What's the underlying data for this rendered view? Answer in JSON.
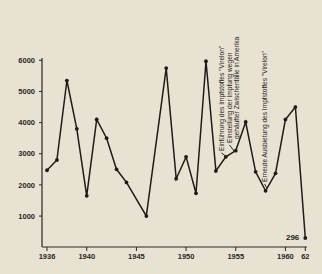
{
  "chart_data": {
    "type": "line",
    "title": "",
    "xlabel": "",
    "ylabel": "",
    "ylim": [
      0,
      6000
    ],
    "grid": false,
    "y_ticks": [
      1000,
      2000,
      3000,
      4000,
      5000,
      6000
    ],
    "y_tick_labels": [
      "1000",
      "2000",
      "3000",
      "4000",
      "5000",
      "6000"
    ],
    "x_ticks": [
      1936,
      1940,
      1945,
      1950,
      1955,
      1960,
      1962
    ],
    "x_tick_labels": [
      "1936",
      "1940",
      "1945",
      "1950",
      "1955",
      "1960",
      "62"
    ],
    "series": [
      {
        "name": "cases",
        "x": [
          1936,
          1937,
          1938,
          1939,
          1940,
          1941,
          1942,
          1943,
          1944,
          1946,
          1948,
          1949,
          1950,
          1951,
          1952,
          1953,
          1954,
          1955,
          1956,
          1957,
          1958,
          1959,
          1960,
          1961,
          1962
        ],
        "values": [
          2470,
          2800,
          5350,
          3800,
          1650,
          4100,
          3500,
          2500,
          2080,
          1000,
          5750,
          2200,
          2900,
          1730,
          5970,
          2450,
          2900,
          3100,
          4020,
          2420,
          1810,
          2370,
          4100,
          4500,
          296
        ]
      }
    ],
    "point_labels": [
      {
        "x": 1962,
        "text": "296"
      }
    ],
    "annotations": [
      {
        "x": 1954,
        "text": "Einführung des Impfstoffes \"Virelon\""
      },
      {
        "x": 1955,
        "text": "Einstellung der Impfung wegen"
      },
      {
        "x": 1955,
        "text": "gehäufter Zwischenfälle in Amerika"
      },
      {
        "x": 1958,
        "text": "Erneute Ausbietung des Impfstoffes \"Virelon\""
      }
    ]
  }
}
